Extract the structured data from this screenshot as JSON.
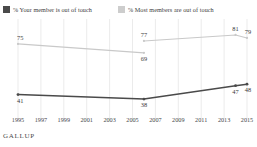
{
  "legend": {
    "items": [
      {
        "name": "your-member",
        "label": "% Your member is out of touch",
        "color": "#4a4a4a"
      },
      {
        "name": "most-members",
        "label": "% Most members are out of touch",
        "color": "#c9c9c9"
      }
    ]
  },
  "footer": {
    "brand": "GALLUP"
  },
  "chart_data": {
    "type": "line",
    "title": "",
    "xlabel": "",
    "ylabel": "",
    "xlim": [
      1995,
      2015
    ],
    "ylim": [
      30,
      85
    ],
    "grid": "vertical",
    "legend_position": "top-left",
    "x_ticks": [
      "1995",
      "1997",
      "1999",
      "2001",
      "2003",
      "2005",
      "2007",
      "2009",
      "2011",
      "2013",
      "2015"
    ],
    "series": [
      {
        "name": "% Most members are out of touch",
        "color": "#c9c9c9",
        "points": [
          {
            "x": 1995,
            "y": 75,
            "label": "75",
            "label_pos": "above"
          },
          {
            "x": 2006,
            "y": 69,
            "label": "69",
            "label_pos": "below"
          },
          {
            "x": 2006,
            "y": 77,
            "label": "77",
            "label_pos": "above",
            "break_before": true
          },
          {
            "x": 2014,
            "y": 81,
            "label": "81",
            "label_pos": "above"
          },
          {
            "x": 2015,
            "y": 79,
            "label": "79",
            "label_pos": "above"
          }
        ]
      },
      {
        "name": "% Your member is out of touch",
        "color": "#4a4a4a",
        "points": [
          {
            "x": 1995,
            "y": 41,
            "label": "41",
            "label_pos": "below"
          },
          {
            "x": 2006,
            "y": 38,
            "label": "38",
            "label_pos": "below"
          },
          {
            "x": 2014,
            "y": 47,
            "label": "47",
            "label_pos": "below"
          },
          {
            "x": 2015,
            "y": 48,
            "label": "48",
            "label_pos": "below"
          }
        ]
      }
    ]
  }
}
